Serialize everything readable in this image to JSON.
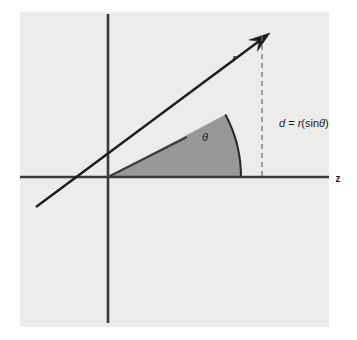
{
  "figure": {
    "title_alt": "Polar geometry diagram showing radius r at angle theta above the z axis",
    "background_color": "#ffffff",
    "plot_area": {
      "fill_color": "#ececeb",
      "x": 20,
      "y": 12,
      "width": 309,
      "height": 315
    },
    "axes": {
      "color": "#3a3a3a",
      "line_width": 2.6,
      "horizontal": {
        "x1": 20,
        "y1": 177,
        "x2": 329,
        "y2": 177
      },
      "vertical": {
        "x1": 108,
        "y1": 14,
        "x2": 108,
        "y2": 323
      },
      "origin": {
        "x": 108,
        "y": 177
      }
    },
    "wedge": {
      "fill_color": "#989898",
      "edge_color": "#2b2b2b",
      "radius": 133,
      "angle_degrees": 28,
      "arc_start": {
        "x": 226,
        "y": 114
      },
      "arc_end_on_axis": {
        "x": 241,
        "y": 177
      }
    },
    "ray": {
      "color": "#1c1c1c",
      "line_width": 2.4,
      "from": {
        "x": 36,
        "y": 207
      },
      "to": {
        "x": 270,
        "y": 33
      },
      "has_arrowhead": true
    },
    "inner_line": {
      "color": "#3d3d3d",
      "line_width": 2.4,
      "from": {
        "x": 108,
        "y": 177
      },
      "to": {
        "x": 187,
        "y": 137
      }
    },
    "dashed_drop_line": {
      "color": "#6a6a6a",
      "line_width": 1.2,
      "dash_pattern": "5 4",
      "x": 262,
      "y_top": 36,
      "y_bottom": 177
    },
    "labels": {
      "radius": {
        "text": "r",
        "x": 234,
        "y": 62,
        "italic": true,
        "font_size": 11
      },
      "angle": {
        "text": "θ",
        "x": 205,
        "y": 141,
        "italic": true,
        "font_size": 11
      },
      "axis_z": {
        "text": "z",
        "x": 338,
        "y": 182,
        "italic": false,
        "font_size": 10
      },
      "distance_formula": {
        "parts": {
          "d": "d",
          "equals": " = ",
          "r": "r",
          "open": "(sin",
          "theta": "θ",
          "close": ")"
        },
        "text": "d = r(sinθ)",
        "x": 279,
        "y": 127,
        "font_size": 11
      }
    }
  }
}
